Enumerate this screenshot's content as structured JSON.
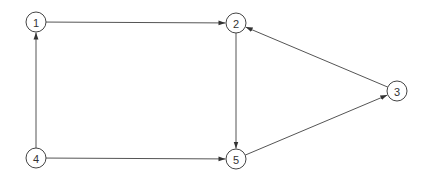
{
  "diagram": {
    "type": "directed-graph",
    "node_radius": 10,
    "colors": {
      "stroke": "#444444",
      "edge": "#555555",
      "label": "#333333",
      "background": "#ffffff"
    },
    "nodes": [
      {
        "id": "1",
        "label": "1",
        "x": 36,
        "y": 22
      },
      {
        "id": "2",
        "label": "2",
        "x": 236,
        "y": 23
      },
      {
        "id": "3",
        "label": "3",
        "x": 397,
        "y": 91
      },
      {
        "id": "4",
        "label": "4",
        "x": 36,
        "y": 158
      },
      {
        "id": "5",
        "label": "5",
        "x": 236,
        "y": 159
      }
    ],
    "edges": [
      {
        "from": "1",
        "to": "2"
      },
      {
        "from": "2",
        "to": "5"
      },
      {
        "from": "5",
        "to": "3"
      },
      {
        "from": "3",
        "to": "2"
      },
      {
        "from": "4",
        "to": "1"
      },
      {
        "from": "4",
        "to": "5"
      }
    ]
  }
}
